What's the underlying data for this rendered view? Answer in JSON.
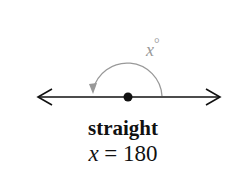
{
  "diagram": {
    "angle_label": "x°",
    "angle_var": "x",
    "angle_symbol": "°",
    "title": "straight",
    "equation_var": "x",
    "equation_rest": " = 180",
    "colors": {
      "line": "#111111",
      "arc": "#999999",
      "vertex": "#111111"
    }
  }
}
